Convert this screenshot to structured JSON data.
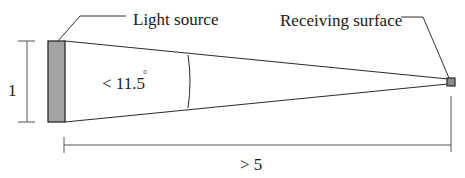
{
  "diagram": {
    "labels": {
      "light_source": "Light source",
      "receiving_surface": "Receiving surface",
      "source_height": "1",
      "angle": "< 11.5",
      "angle_unit": "°",
      "distance": "> 5"
    },
    "colors": {
      "source_fill": "#a3a3a3",
      "receiver_fill": "#8c8c8c",
      "stroke": "#2a2a2a",
      "dimension_stroke": "#555555"
    }
  }
}
